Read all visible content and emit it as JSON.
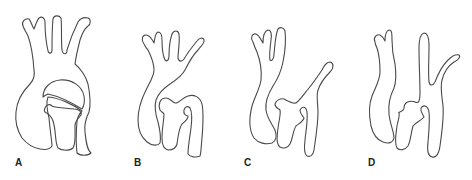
{
  "figure": {
    "stroke_color": "#4a4a4a",
    "background": "#ffffff",
    "panels": [
      {
        "id": "A",
        "label": "A",
        "label_x": 15,
        "label_y": 158
      },
      {
        "id": "B",
        "label": "B",
        "label_x": 134,
        "label_y": 158
      },
      {
        "id": "C",
        "label": "C",
        "label_x": 244,
        "label_y": 158
      },
      {
        "id": "D",
        "label": "D",
        "label_x": 368,
        "label_y": 158
      }
    ]
  }
}
